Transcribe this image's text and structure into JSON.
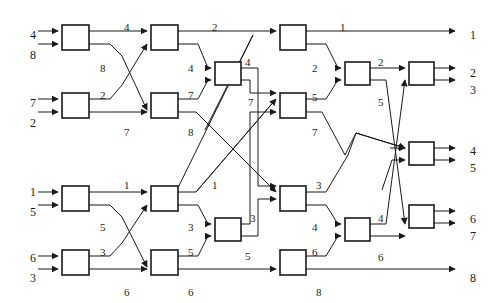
{
  "diagram": {
    "type": "sorting-network",
    "width": 490,
    "height": 303,
    "stroke_color": "#1a1a1a",
    "label_color": "#1a1a1a",
    "background": "#ffffff",
    "comparator_count": 19,
    "line_count": 8
  },
  "inputs": [
    {
      "id": "in-1",
      "value": "4",
      "x": 30,
      "y": 29
    },
    {
      "id": "in-2",
      "value": "8",
      "x": 30,
      "y": 49
    },
    {
      "id": "in-3",
      "value": "7",
      "x": 30,
      "y": 97
    },
    {
      "id": "in-4",
      "value": "2",
      "x": 30,
      "y": 117
    },
    {
      "id": "in-5",
      "value": "1",
      "x": 30,
      "y": 186
    },
    {
      "id": "in-6",
      "value": "5",
      "x": 30,
      "y": 206
    },
    {
      "id": "in-7",
      "value": "6",
      "x": 30,
      "y": 252
    },
    {
      "id": "in-8",
      "value": "3",
      "x": 30,
      "y": 272
    }
  ],
  "outputs": [
    {
      "id": "out-1",
      "value": "1",
      "x": 470,
      "y": 29
    },
    {
      "id": "out-2",
      "value": "2",
      "x": 470,
      "y": 67
    },
    {
      "id": "out-3",
      "value": "3",
      "x": 470,
      "y": 84
    },
    {
      "id": "out-4",
      "value": "4",
      "x": 470,
      "y": 145
    },
    {
      "id": "out-5",
      "value": "5",
      "x": 470,
      "y": 162
    },
    {
      "id": "out-6",
      "value": "6",
      "x": 470,
      "y": 213
    },
    {
      "id": "out-7",
      "value": "7",
      "x": 470,
      "y": 230
    },
    {
      "id": "out-8",
      "value": "8",
      "x": 470,
      "y": 272
    }
  ],
  "wire_labels": [
    {
      "id": "wl-1",
      "value": "4",
      "x": 124,
      "y": 22
    },
    {
      "id": "wl-2",
      "value": "8",
      "x": 100,
      "y": 63
    },
    {
      "id": "wl-3",
      "value": "2",
      "x": 100,
      "y": 90
    },
    {
      "id": "wl-4",
      "value": "7",
      "x": 124,
      "y": 127
    },
    {
      "id": "wl-5",
      "value": "2",
      "x": 212,
      "y": 22
    },
    {
      "id": "wl-6",
      "value": "4",
      "x": 188,
      "y": 63
    },
    {
      "id": "wl-7",
      "value": "7",
      "x": 188,
      "y": 90
    },
    {
      "id": "wl-8",
      "value": "8",
      "x": 188,
      "y": 127
    },
    {
      "id": "wl-9",
      "value": "4",
      "x": 245,
      "y": 57
    },
    {
      "id": "wl-10",
      "value": "7",
      "x": 248,
      "y": 97
    },
    {
      "id": "wl-11",
      "value": "1",
      "x": 340,
      "y": 22
    },
    {
      "id": "wl-12",
      "value": "2",
      "x": 312,
      "y": 63
    },
    {
      "id": "wl-13",
      "value": "5",
      "x": 312,
      "y": 92
    },
    {
      "id": "wl-14",
      "value": "7",
      "x": 312,
      "y": 127
    },
    {
      "id": "wl-15",
      "value": "2",
      "x": 378,
      "y": 57
    },
    {
      "id": "wl-16",
      "value": "5",
      "x": 378,
      "y": 97
    },
    {
      "id": "wl-17",
      "value": "1",
      "x": 124,
      "y": 180
    },
    {
      "id": "wl-18",
      "value": "5",
      "x": 100,
      "y": 222
    },
    {
      "id": "wl-19",
      "value": "3",
      "x": 100,
      "y": 247
    },
    {
      "id": "wl-20",
      "value": "6",
      "x": 124,
      "y": 287
    },
    {
      "id": "wl-21",
      "value": "1",
      "x": 212,
      "y": 180
    },
    {
      "id": "wl-22",
      "value": "3",
      "x": 188,
      "y": 222
    },
    {
      "id": "wl-23",
      "value": "5",
      "x": 188,
      "y": 247
    },
    {
      "id": "wl-24",
      "value": "6",
      "x": 188,
      "y": 287
    },
    {
      "id": "wl-25",
      "value": "3",
      "x": 250,
      "y": 213
    },
    {
      "id": "wl-26",
      "value": "5",
      "x": 245,
      "y": 251
    },
    {
      "id": "wl-27",
      "value": "3",
      "x": 316,
      "y": 180
    },
    {
      "id": "wl-28",
      "value": "4",
      "x": 312,
      "y": 222
    },
    {
      "id": "wl-29",
      "value": "6",
      "x": 312,
      "y": 247
    },
    {
      "id": "wl-30",
      "value": "8",
      "x": 316,
      "y": 287
    },
    {
      "id": "wl-31",
      "value": "4",
      "x": 378,
      "y": 213
    },
    {
      "id": "wl-32",
      "value": "6",
      "x": 378,
      "y": 252
    }
  ],
  "comparators": [
    {
      "id": "cmp-1",
      "stage": 1,
      "x": 62,
      "y": 25,
      "w": 27,
      "h": 25
    },
    {
      "id": "cmp-2",
      "stage": 1,
      "x": 62,
      "y": 93,
      "w": 27,
      "h": 25
    },
    {
      "id": "cmp-3",
      "stage": 1,
      "x": 62,
      "y": 186,
      "w": 27,
      "h": 25
    },
    {
      "id": "cmp-4",
      "stage": 1,
      "x": 62,
      "y": 250,
      "w": 27,
      "h": 25
    },
    {
      "id": "cmp-5",
      "stage": 2,
      "x": 151,
      "y": 25,
      "w": 27,
      "h": 25
    },
    {
      "id": "cmp-6",
      "stage": 2,
      "x": 151,
      "y": 93,
      "w": 27,
      "h": 25
    },
    {
      "id": "cmp-7",
      "stage": 2,
      "x": 151,
      "y": 186,
      "w": 27,
      "h": 25
    },
    {
      "id": "cmp-8",
      "stage": 2,
      "x": 151,
      "y": 250,
      "w": 27,
      "h": 25
    },
    {
      "id": "cmp-9",
      "stage": 3,
      "x": 215,
      "y": 62,
      "w": 26,
      "h": 23
    },
    {
      "id": "cmp-10",
      "stage": 3,
      "x": 215,
      "y": 218,
      "w": 26,
      "h": 23
    },
    {
      "id": "cmp-11",
      "stage": 4,
      "x": 280,
      "y": 25,
      "w": 26,
      "h": 25
    },
    {
      "id": "cmp-12",
      "stage": 4,
      "x": 280,
      "y": 93,
      "w": 26,
      "h": 25
    },
    {
      "id": "cmp-13",
      "stage": 4,
      "x": 280,
      "y": 186,
      "w": 26,
      "h": 25
    },
    {
      "id": "cmp-14",
      "stage": 4,
      "x": 280,
      "y": 250,
      "w": 26,
      "h": 25
    },
    {
      "id": "cmp-15",
      "stage": 5,
      "x": 345,
      "y": 62,
      "w": 25,
      "h": 23
    },
    {
      "id": "cmp-16",
      "stage": 5,
      "x": 345,
      "y": 218,
      "w": 25,
      "h": 23
    },
    {
      "id": "cmp-17",
      "stage": 6,
      "x": 409,
      "y": 62,
      "w": 25,
      "h": 23
    },
    {
      "id": "cmp-18",
      "stage": 6,
      "x": 409,
      "y": 142,
      "w": 25,
      "h": 23
    },
    {
      "id": "cmp-19",
      "stage": 6,
      "x": 409,
      "y": 205,
      "w": 25,
      "h": 23
    }
  ]
}
